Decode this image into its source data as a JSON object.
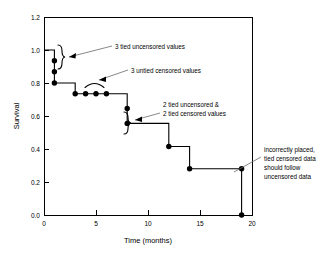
{
  "chart_data": {
    "type": "line",
    "subtype": "kaplan-meier-step",
    "title": "",
    "xlabel": "Time (months)",
    "ylabel": "Survival",
    "xlim": [
      0,
      20
    ],
    "ylim": [
      0.0,
      1.2
    ],
    "xticks": [
      "0",
      "5",
      "10",
      "15",
      "20"
    ],
    "xtick_values": [
      0,
      5,
      10,
      15,
      20
    ],
    "yticks": [
      "0.0",
      "0.2",
      "0.4",
      "0.6",
      "0.8",
      "1.0",
      "1.2"
    ],
    "ytick_values": [
      0.0,
      0.2,
      0.4,
      0.6,
      0.8,
      1.0,
      1.2
    ],
    "grid": false,
    "legend": "none",
    "step_x": [
      0,
      1,
      1,
      3,
      3,
      8,
      8,
      12,
      12,
      14,
      14,
      19,
      19
    ],
    "step_y": [
      1.0,
      1.0,
      0.8,
      0.8,
      0.735,
      0.735,
      0.555,
      0.555,
      0.415,
      0.415,
      0.28,
      0.28,
      0.0
    ],
    "points": [
      {
        "x": 1,
        "y": 0.935,
        "label": "tied uncensored"
      },
      {
        "x": 1,
        "y": 0.868,
        "label": "tied uncensored"
      },
      {
        "x": 1,
        "y": 0.8,
        "label": "tied uncensored"
      },
      {
        "x": 3,
        "y": 0.735,
        "label": "censored"
      },
      {
        "x": 4,
        "y": 0.735,
        "label": "censored"
      },
      {
        "x": 5,
        "y": 0.735,
        "label": "censored"
      },
      {
        "x": 6,
        "y": 0.735,
        "label": "censored"
      },
      {
        "x": 8,
        "y": 0.645,
        "label": "tied uncensored/censored"
      },
      {
        "x": 8,
        "y": 0.555,
        "label": "tied uncensored/censored"
      },
      {
        "x": 12,
        "y": 0.415,
        "label": "event"
      },
      {
        "x": 14,
        "y": 0.28,
        "label": "event"
      },
      {
        "x": 19,
        "y": 0.28,
        "label": "tied censored misplaced"
      },
      {
        "x": 19,
        "y": 0.0,
        "label": "event"
      }
    ],
    "annotations": [
      {
        "id": "annot-tied-uncensored",
        "lines": [
          "3 tied uncensored values"
        ],
        "text_x": 115,
        "text_y": 49,
        "anchor": "start",
        "leader": [
          [
            112,
            46
          ],
          [
            92,
            56
          ]
        ]
      },
      {
        "id": "annot-untied-censored",
        "lines": [
          "3 untied censored values"
        ],
        "text_x": 131,
        "text_y": 73,
        "anchor": "start",
        "leader": [
          [
            128,
            70
          ],
          [
            108,
            79
          ]
        ]
      },
      {
        "id": "annot-tied-both",
        "lines": [
          "2 tied uncensored &",
          "2 tied censored values"
        ],
        "text_x": 163,
        "text_y": 107,
        "anchor": "start",
        "leader": [
          [
            160,
            113
          ],
          [
            139,
            118
          ]
        ]
      },
      {
        "id": "annot-incorrect-placement",
        "lines": [
          "incorrectly placed,",
          "tied censored data",
          "should follow",
          "uncensored data"
        ],
        "text_x": 264,
        "text_y": 152,
        "anchor": "start",
        "leader": [
          [
            261,
            157
          ],
          [
            240,
            172
          ]
        ]
      }
    ],
    "braces": [
      {
        "id": "brace-tied-uncensored",
        "x": 60,
        "y_top": 45,
        "y_bottom": 69
      },
      {
        "id": "brace-tied-both",
        "x": 126,
        "y_top": 112,
        "y_bottom": 134
      },
      {
        "id": "arc-untied-censored",
        "x_left": 85,
        "x_right": 104,
        "y": 86
      }
    ]
  }
}
